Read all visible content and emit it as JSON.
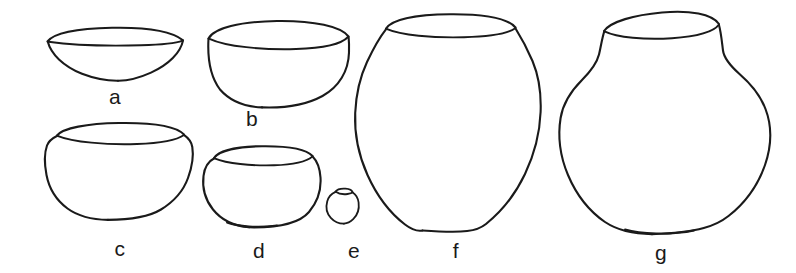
{
  "figure": {
    "type": "line-drawing",
    "background_color": "#ffffff",
    "ink_color": "#1a1a1a",
    "width": 796,
    "height": 273,
    "label_count": 7
  },
  "vessels": [
    {
      "id": "a",
      "label": "a",
      "form": "shallow open bowl",
      "label_x": 115,
      "label_y": 86,
      "bounds": {
        "x": 47,
        "y": 28,
        "w": 136,
        "h": 53
      }
    },
    {
      "id": "b",
      "label": "b",
      "form": "deep hemispherical bowl",
      "label_x": 252,
      "label_y": 108,
      "bounds": {
        "x": 206,
        "y": 20,
        "w": 144,
        "h": 88
      }
    },
    {
      "id": "c",
      "label": "c",
      "form": "neckless jar with everted rim",
      "label_x": 120,
      "label_y": 238,
      "bounds": {
        "x": 44,
        "y": 122,
        "w": 148,
        "h": 98
      }
    },
    {
      "id": "d",
      "label": "d",
      "form": "small globular bowl",
      "label_x": 259,
      "label_y": 240,
      "bounds": {
        "x": 203,
        "y": 146,
        "w": 118,
        "h": 82
      }
    },
    {
      "id": "e",
      "label": "e",
      "form": "miniature globular jar",
      "label_x": 354,
      "label_y": 240,
      "bounds": {
        "x": 326,
        "y": 188,
        "w": 32,
        "h": 36
      }
    },
    {
      "id": "f",
      "label": "f",
      "form": "large ovoid jar with short neck",
      "label_x": 456,
      "label_y": 240,
      "bounds": {
        "x": 355,
        "y": 14,
        "w": 186,
        "h": 216
      }
    },
    {
      "id": "g",
      "label": "g",
      "form": "large globular jar with constricted neck",
      "label_x": 661,
      "label_y": 242,
      "bounds": {
        "x": 560,
        "y": 12,
        "w": 210,
        "h": 222
      }
    }
  ]
}
